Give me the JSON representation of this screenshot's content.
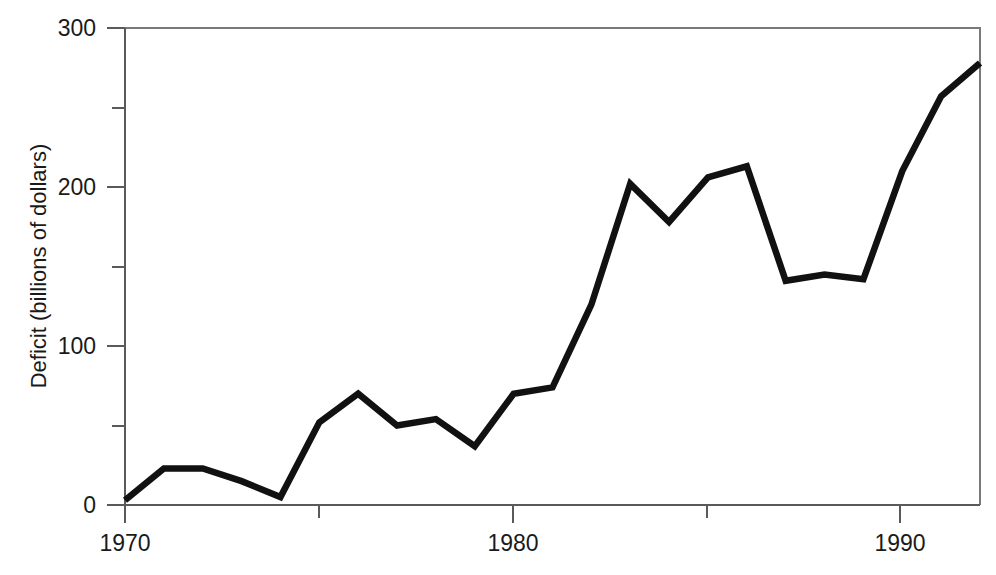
{
  "chart_data": {
    "type": "line",
    "title": "",
    "xlabel": "",
    "ylabel": "Deficit (billions of dollars)",
    "xlim": [
      1970,
      1992
    ],
    "ylim": [
      0,
      300
    ],
    "grid": false,
    "legend": null,
    "x_major_ticks": [
      1970,
      1980,
      1990
    ],
    "x_major_tick_labels": [
      "1970",
      "1980",
      "1990"
    ],
    "x_minor_ticks": [
      1975,
      1985
    ],
    "y_major_ticks": [
      0,
      100,
      200,
      300
    ],
    "y_major_tick_labels": [
      "0",
      "100",
      "200",
      "300"
    ],
    "y_minor_ticks": [
      50,
      150,
      250
    ],
    "series": [
      {
        "name": "Deficit",
        "color": "#111111",
        "x": [
          1970,
          1971,
          1972,
          1973,
          1974,
          1975,
          1976,
          1977,
          1978,
          1979,
          1980,
          1981,
          1982,
          1983,
          1984,
          1985,
          1986,
          1987,
          1988,
          1989,
          1990,
          1991,
          1992
        ],
        "values": [
          3,
          23,
          23,
          15,
          5,
          52,
          70,
          50,
          54,
          37,
          70,
          74,
          126,
          202,
          178,
          206,
          213,
          141,
          145,
          142,
          210,
          257,
          278
        ]
      }
    ]
  },
  "axis": {
    "y_title": "Deficit (billions of dollars)",
    "y_labels": {
      "t0": "0",
      "t100": "100",
      "t200": "200",
      "t300": "300"
    },
    "x_labels": {
      "t1970": "1970",
      "t1980": "1980",
      "t1990": "1990"
    }
  }
}
